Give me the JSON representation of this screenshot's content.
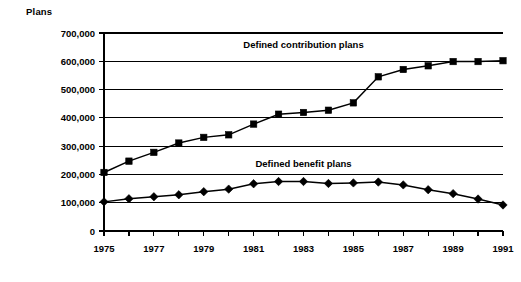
{
  "chart_data": {
    "type": "line",
    "title": "",
    "subtitle": "",
    "xlabel": "",
    "ylabel": "Plans",
    "ylim": [
      0,
      700000
    ],
    "xlim": [
      1975,
      1991
    ],
    "grid": true,
    "legend_position": "inline-annotation",
    "y_ticks": [
      "0",
      "100,000",
      "200,000",
      "300,000",
      "400,000",
      "500,000",
      "600,000",
      "700,000"
    ],
    "y_tick_values": [
      0,
      100000,
      200000,
      300000,
      400000,
      500000,
      600000,
      700000
    ],
    "x_ticks": [
      "1975",
      "1977",
      "1979",
      "1981",
      "1983",
      "1985",
      "1987",
      "1989",
      "1991"
    ],
    "x_tick_values": [
      1975,
      1977,
      1979,
      1981,
      1983,
      1985,
      1987,
      1989,
      1991
    ],
    "x": [
      1975,
      1976,
      1977,
      1978,
      1979,
      1980,
      1981,
      1982,
      1983,
      1984,
      1985,
      1986,
      1987,
      1988,
      1989,
      1990,
      1991
    ],
    "series": [
      {
        "name": "Defined contribution plans",
        "marker": "square",
        "values": [
          207000,
          247000,
          278000,
          311000,
          331000,
          340000,
          378000,
          413000,
          419000,
          427000,
          453000,
          545000,
          571000,
          584000,
          599000,
          599000,
          602000
        ]
      },
      {
        "name": "Defined benefit plans",
        "marker": "diamond",
        "values": [
          103000,
          114000,
          121000,
          128000,
          139000,
          148000,
          167000,
          175000,
          175000,
          168000,
          170000,
          173000,
          163000,
          146000,
          132000,
          113000,
          92000
        ]
      }
    ],
    "annotations": [
      {
        "text": "Defined contribution plans",
        "x": 1983.0,
        "y": 648000
      },
      {
        "text": "Defined benefit plans",
        "x": 1983.0,
        "y": 225000
      }
    ]
  }
}
